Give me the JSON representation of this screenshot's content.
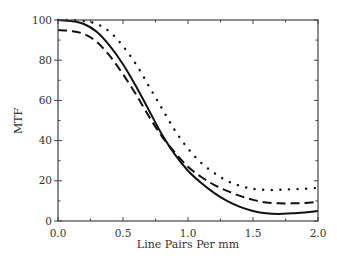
{
  "chart_data": {
    "type": "line",
    "title": "",
    "xlabel": "Line Pairs Per mm",
    "ylabel": "MTF",
    "xlim": [
      0.0,
      2.0
    ],
    "ylim": [
      0,
      100
    ],
    "xticks": [
      "0.0",
      "0.5",
      "1.0",
      "1.5",
      "2.0"
    ],
    "yticks": [
      "0",
      "20",
      "40",
      "60",
      "80",
      "100"
    ],
    "grid": false,
    "legend": null,
    "x": [
      0.0,
      0.1,
      0.2,
      0.3,
      0.4,
      0.5,
      0.6,
      0.7,
      0.8,
      0.9,
      1.0,
      1.1,
      1.2,
      1.3,
      1.4,
      1.5,
      1.6,
      1.7,
      1.8,
      1.9,
      2.0
    ],
    "series": [
      {
        "name": "solid",
        "style": "solid",
        "values": [
          100,
          99.5,
          98,
          94,
          87,
          78,
          67,
          55,
          43,
          33,
          25,
          19,
          14,
          10,
          7,
          5,
          3.8,
          3.5,
          3.8,
          4.2,
          5
        ]
      },
      {
        "name": "dashed",
        "style": "dashed",
        "values": [
          95,
          94.5,
          93,
          89,
          82,
          73,
          63,
          52,
          42,
          34,
          27,
          22,
          18,
          15,
          12.5,
          10.5,
          9.2,
          8.8,
          8.8,
          9,
          9.5
        ]
      },
      {
        "name": "dotted",
        "style": "dotted",
        "values": [
          100,
          100,
          99.5,
          98,
          94,
          87,
          78,
          67,
          56,
          45,
          36,
          29,
          24,
          20,
          17.5,
          16,
          15.5,
          15.5,
          15.8,
          16,
          16.5
        ]
      }
    ]
  }
}
